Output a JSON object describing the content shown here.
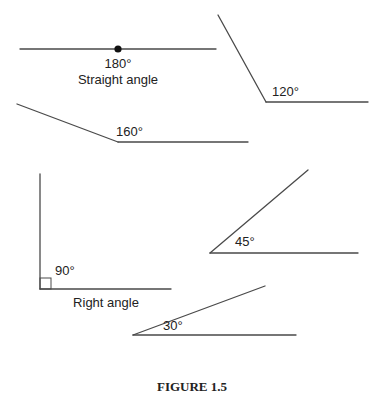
{
  "figure": {
    "caption": "FIGURE 1.5",
    "angles": [
      {
        "id": "straight",
        "degrees": 180,
        "label": "180°",
        "name": "Straight angle"
      },
      {
        "id": "obtuse-120",
        "degrees": 120,
        "label": "120°"
      },
      {
        "id": "obtuse-160",
        "degrees": 160,
        "label": "160°"
      },
      {
        "id": "right",
        "degrees": 90,
        "label": "90°",
        "name": "Right angle"
      },
      {
        "id": "acute-45",
        "degrees": 45,
        "label": "45°"
      },
      {
        "id": "acute-30",
        "degrees": 30,
        "label": "30°"
      }
    ]
  }
}
